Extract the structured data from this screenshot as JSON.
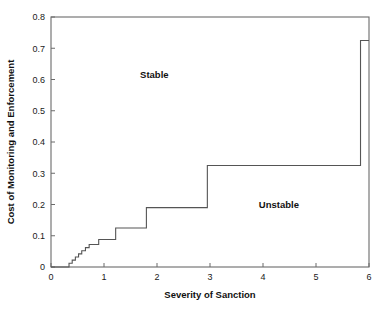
{
  "chart_data": {
    "type": "line",
    "title": "",
    "xlabel": "Severity of Sanction",
    "ylabel": "Cost of Monitoring and Enforcement",
    "xlim": [
      0,
      6
    ],
    "ylim": [
      0,
      0.8
    ],
    "xticks": [
      0,
      1,
      2,
      3,
      4,
      5,
      6
    ],
    "xtick_labels": [
      "0",
      "1",
      "2",
      "3",
      "4",
      "5",
      "6"
    ],
    "yticks": [
      0,
      0.1,
      0.2,
      0.3,
      0.4,
      0.5,
      0.6,
      0.7,
      0.8
    ],
    "ytick_labels": [
      "0",
      "0.1",
      "0.2",
      "0.3",
      "0.4",
      "0.5",
      "0.6",
      "0.7",
      "0.8"
    ],
    "grid": false,
    "legend": null,
    "line_color": "#555555",
    "background_color": "#ffffff",
    "frame_color": "#6b6b6b",
    "series": [
      {
        "name": "stability boundary",
        "style": "step-post",
        "x": [
          0.0,
          0.34,
          0.34,
          0.4,
          0.4,
          0.46,
          0.46,
          0.52,
          0.52,
          0.58,
          0.58,
          0.65,
          0.65,
          0.72,
          0.72,
          0.9,
          0.9,
          1.22,
          1.22,
          1.8,
          1.8,
          2.95,
          2.95,
          5.84,
          5.84,
          6.0
        ],
        "y": [
          0.0,
          0.0,
          0.012,
          0.012,
          0.022,
          0.022,
          0.032,
          0.032,
          0.042,
          0.042,
          0.052,
          0.052,
          0.062,
          0.062,
          0.072,
          0.072,
          0.088,
          0.088,
          0.125,
          0.125,
          0.19,
          0.19,
          0.325,
          0.325,
          0.725,
          0.725
        ]
      }
    ],
    "annotations": [
      {
        "text": "Stable",
        "x": 1.95,
        "y": 0.605
      },
      {
        "text": "Unstable",
        "x": 4.3,
        "y": 0.19
      }
    ]
  },
  "axis": {
    "x_title": "Severity of Sanction",
    "y_title": "Cost of Monitoring and Enforcement"
  },
  "regions": {
    "stable_label": "Stable",
    "unstable_label": "Unstable"
  }
}
